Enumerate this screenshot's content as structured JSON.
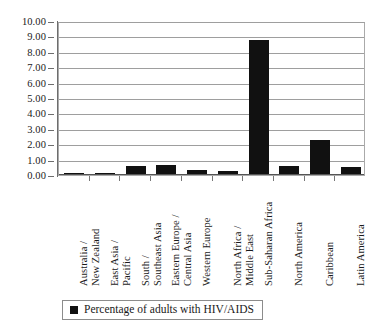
{
  "chart_data": {
    "type": "bar",
    "title": "",
    "xlabel": "",
    "ylabel": "",
    "ylim": [
      0,
      10
    ],
    "grid": true,
    "legend_position": "bottom",
    "categories": [
      "Australia / New Zealand",
      "East Asia / Pacific",
      "South / Southeast Asia",
      "Eastern Europe / Central Asia",
      "Western Europe",
      "North Africa / Middle East",
      "Sub-Saharan Africa",
      "North America",
      "Caribbean",
      "Latin America"
    ],
    "category_lines": [
      [
        "Australia /",
        "New Zealand"
      ],
      [
        "East Asia /",
        "Pacific"
      ],
      [
        "South /",
        "Southeast Asia"
      ],
      [
        "Eastern Europe /",
        "Central Asia"
      ],
      [
        "Western Europe",
        ""
      ],
      [
        "North Africa /",
        "Middle East"
      ],
      [
        "Sub-Saharan Africa",
        ""
      ],
      [
        "North America",
        ""
      ],
      [
        "Caribbean",
        ""
      ],
      [
        "Latin America",
        ""
      ]
    ],
    "values": [
      0.1,
      0.1,
      0.6,
      0.65,
      0.3,
      0.25,
      8.75,
      0.6,
      2.3,
      0.55
    ],
    "series": [
      {
        "name": "Percentage of adults with HIV/AIDS",
        "color": "#111111",
        "values": [
          0.1,
          0.1,
          0.6,
          0.65,
          0.3,
          0.25,
          8.75,
          0.6,
          2.3,
          0.55
        ]
      }
    ],
    "y_ticks": [
      "0.00",
      "1.00",
      "2.00",
      "3.00",
      "4.00",
      "5.00",
      "6.00",
      "7.00",
      "8.00",
      "9.00",
      "10.00"
    ],
    "y_tick_values": [
      0,
      1,
      2,
      3,
      4,
      5,
      6,
      7,
      8,
      9,
      10
    ]
  },
  "legend": {
    "entries": [
      {
        "label": "Percentage of adults with HIV/AIDS",
        "color": "#111111"
      }
    ]
  }
}
